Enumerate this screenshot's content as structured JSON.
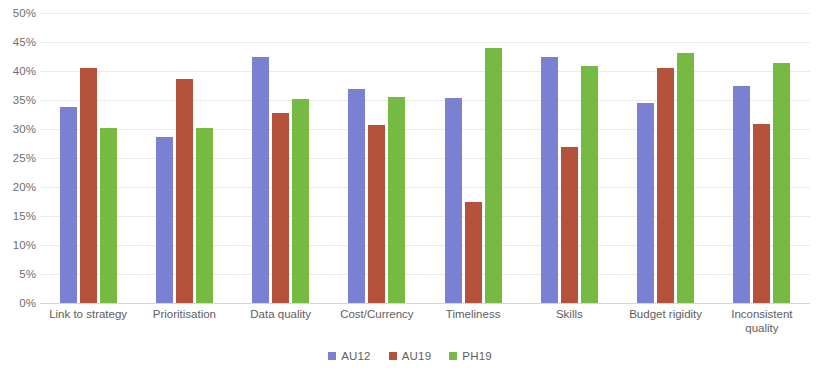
{
  "chart_data": {
    "type": "bar",
    "title": "",
    "subtitle": "",
    "xlabel": "",
    "ylabel": "",
    "ylim": [
      0,
      50
    ],
    "ytick_values": [
      0,
      5,
      10,
      15,
      20,
      25,
      30,
      35,
      40,
      45,
      50
    ],
    "ytick_labels": [
      "0%",
      "5%",
      "10%",
      "15%",
      "20%",
      "25%",
      "30%",
      "35%",
      "40%",
      "45%",
      "50%"
    ],
    "grid": true,
    "legend_position": "bottom-center",
    "categories": [
      "Link to strategy",
      "Prioritisation",
      "Data quality",
      "Cost/Currency",
      "Timeliness",
      "Skills",
      "Budget rigidity",
      "Inconsistent quality"
    ],
    "series": [
      {
        "name": "AU12",
        "color": "#7b80d2",
        "values": [
          33.8,
          28.6,
          42.5,
          36.9,
          35.3,
          42.5,
          34.4,
          37.4
        ]
      },
      {
        "name": "AU19",
        "color": "#b5523b",
        "values": [
          40.5,
          38.6,
          32.8,
          30.7,
          17.4,
          26.9,
          40.5,
          30.8
        ]
      },
      {
        "name": "PH19",
        "color": "#76b943",
        "values": [
          30.2,
          30.2,
          35.1,
          35.6,
          44.0,
          40.9,
          43.1,
          41.4
        ]
      }
    ]
  }
}
